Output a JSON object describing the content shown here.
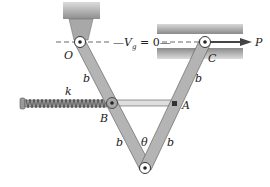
{
  "figure": {
    "type": "mechanism"
  },
  "labels": {
    "pivot_O": "O",
    "slider_C": "C",
    "force_P": "P",
    "joint_A": "A",
    "joint_B": "B",
    "spring_k": "k",
    "angle": "θ",
    "link_length": "b",
    "datum_prefix": "V",
    "datum_subscript": "g",
    "datum_suffix": " = 0"
  },
  "colors": {
    "link_fill": "#b4b4b4",
    "link_stroke": "#555555",
    "wall_dark": "#8a8a8a",
    "wall_light": "#d6d6d6",
    "pin": "#222222",
    "line": "#333333"
  }
}
